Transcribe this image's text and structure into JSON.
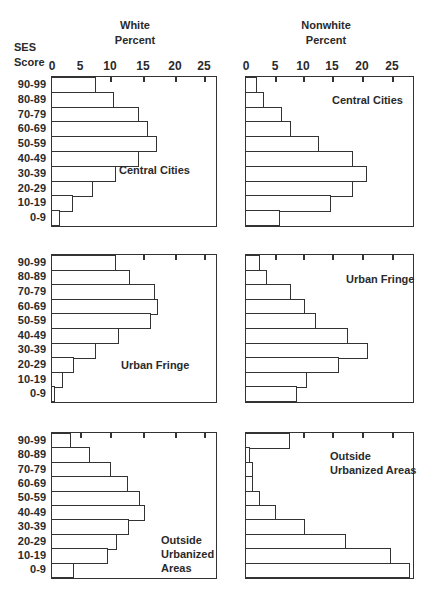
{
  "headers": {
    "ses_line1": "SES",
    "ses_line2": "Score",
    "white_line1": "White",
    "white_line2": "Percent",
    "nonwhite_line1": "Nonwhite",
    "nonwhite_line2": "Percent"
  },
  "axis_ticks": [
    "0",
    "5",
    "10",
    "15",
    "20",
    "25"
  ],
  "categories": [
    "90-99",
    "80-89",
    "70-79",
    "60-69",
    "50-59",
    "40-49",
    "30-39",
    "20-29",
    "10-19",
    "0-9"
  ],
  "panel_labels": {
    "central_cities": "Central Cities",
    "urban_fringe": "Urban Fringe",
    "outside_1": "Outside",
    "outside_2": "Urbanized",
    "outside_3": "Areas",
    "outside_nw_1": "Outside",
    "outside_nw_2": "Urbanized Areas"
  },
  "chart_data": [
    {
      "type": "bar",
      "orientation": "horizontal",
      "title": "Central Cities - White",
      "xlabel": "White Percent",
      "ylabel": "SES Score",
      "categories": [
        "90-99",
        "80-89",
        "70-79",
        "60-69",
        "50-59",
        "40-49",
        "30-39",
        "20-29",
        "10-19",
        "0-9"
      ],
      "values": [
        7,
        10,
        14,
        15.5,
        17,
        14,
        10.3,
        6.5,
        3.2,
        1.2
      ],
      "xlim": [
        0,
        27
      ],
      "xticks": [
        0,
        5,
        10,
        15,
        20,
        25
      ]
    },
    {
      "type": "bar",
      "orientation": "horizontal",
      "title": "Central Cities - Nonwhite",
      "xlabel": "Nonwhite Percent",
      "ylabel": "SES Score",
      "categories": [
        "90-99",
        "80-89",
        "70-79",
        "60-69",
        "50-59",
        "40-49",
        "30-39",
        "20-29",
        "10-19",
        "0-9"
      ],
      "values": [
        1.7,
        3,
        6,
        7.6,
        12.3,
        18.1,
        20.6,
        18.1,
        14.4,
        5.7
      ],
      "xlim": [
        0,
        29
      ],
      "xticks": [
        0,
        5,
        10,
        15,
        20,
        25
      ]
    },
    {
      "type": "bar",
      "orientation": "horizontal",
      "title": "Urban Fringe - White",
      "xlabel": "White Percent",
      "ylabel": "SES Score",
      "categories": [
        "90-99",
        "80-89",
        "70-79",
        "60-69",
        "50-59",
        "40-49",
        "30-39",
        "20-29",
        "10-19",
        "0-9"
      ],
      "values": [
        10.3,
        12.6,
        16.6,
        17.2,
        16,
        10.8,
        7,
        3.5,
        1.6,
        0.4
      ],
      "xlim": [
        0,
        27
      ],
      "xticks": [
        0,
        5,
        10,
        15,
        20,
        25
      ]
    },
    {
      "type": "bar",
      "orientation": "horizontal",
      "title": "Urban Fringe - Nonwhite",
      "xlabel": "Nonwhite Percent",
      "ylabel": "SES Score",
      "categories": [
        "90-99",
        "80-89",
        "70-79",
        "60-69",
        "50-59",
        "40-49",
        "30-39",
        "20-29",
        "10-19",
        "0-9"
      ],
      "values": [
        2.2,
        3.4,
        7.6,
        10,
        11.8,
        17.4,
        20.8,
        15.8,
        10.3,
        8.6
      ],
      "xlim": [
        0,
        29
      ],
      "xticks": [
        0,
        5,
        10,
        15,
        20,
        25
      ]
    },
    {
      "type": "bar",
      "orientation": "horizontal",
      "title": "Outside Urbanized Areas - White",
      "xlabel": "White Percent",
      "ylabel": "SES Score",
      "categories": [
        "90-99",
        "80-89",
        "70-79",
        "60-69",
        "50-59",
        "40-49",
        "30-39",
        "20-29",
        "10-19",
        "0-9"
      ],
      "values": [
        3,
        6,
        9.5,
        12.3,
        14.2,
        15,
        12.4,
        10.5,
        9,
        3.4
      ],
      "xlim": [
        0,
        27
      ],
      "xticks": [
        0,
        5,
        10,
        15,
        20,
        25
      ]
    },
    {
      "type": "bar",
      "orientation": "horizontal",
      "title": "Outside Urbanized Areas - Nonwhite",
      "xlabel": "Nonwhite Percent",
      "ylabel": "SES Score",
      "categories": [
        "90-99",
        "80-89",
        "70-79",
        "60-69",
        "50-59",
        "40-49",
        "30-39",
        "20-29",
        "10-19",
        "0-9"
      ],
      "values": [
        7.3,
        0.6,
        1.1,
        1.1,
        2.2,
        5,
        10,
        16.9,
        24.7,
        28
      ],
      "xlim": [
        0,
        29
      ],
      "xticks": [
        0,
        5,
        10,
        15,
        20,
        25
      ]
    }
  ]
}
